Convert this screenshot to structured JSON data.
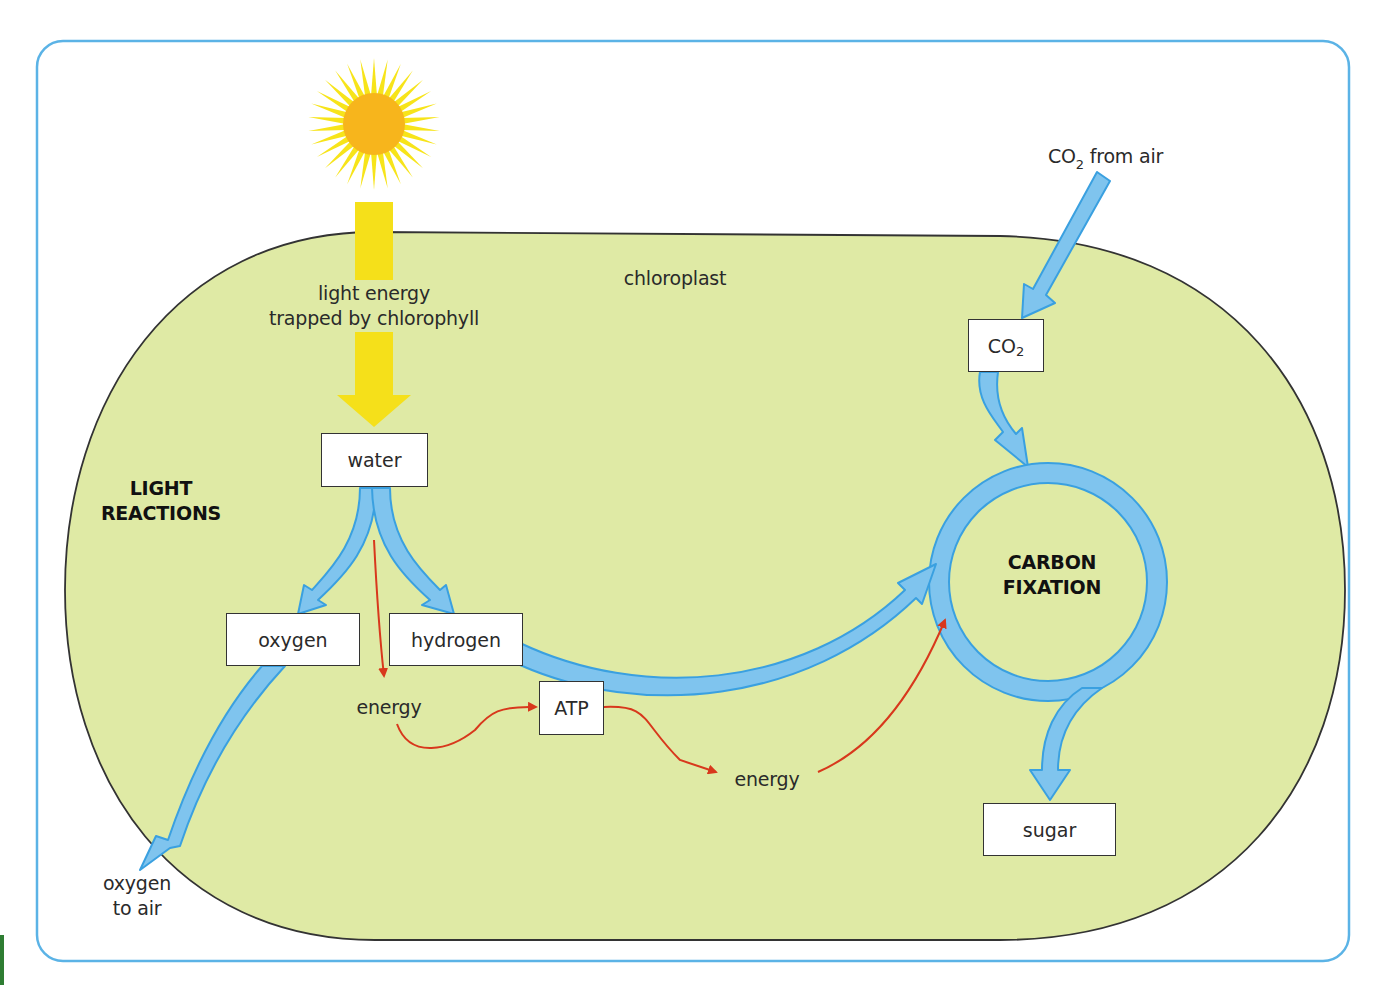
{
  "diagram": {
    "title_region": "chloroplast",
    "colors": {
      "frame_border": "#5bb3e6",
      "chloroplast_fill": "#dfeaa5",
      "chloroplast_outline": "#333333",
      "flow_arrow_fill": "#7fc4ee",
      "flow_arrow_stroke": "#3aa0e0",
      "light_arrow": "#f5e01a",
      "sun_core": "#f7b51c",
      "sun_rays": "#f7e41a",
      "energy_arrow": "#d8381c"
    },
    "labels": {
      "chloroplast": "chloroplast",
      "light_energy_line1": "light energy",
      "light_energy_line2": "trapped by chlorophyll",
      "light_reactions_line1": "LIGHT",
      "light_reactions_line2": "REACTIONS",
      "carbon_fixation_line1": "CARBON",
      "carbon_fixation_line2": "FIXATION",
      "co2_from_air_prefix": "CO",
      "co2_from_air_sub": "2",
      "co2_from_air_suffix": " from air",
      "oxygen_to_air_line1": "oxygen",
      "oxygen_to_air_line2": "to air",
      "energy_1": "energy",
      "energy_2": "energy"
    },
    "boxes": {
      "water": "water",
      "oxygen": "oxygen",
      "hydrogen": "hydrogen",
      "atp": "ATP",
      "co2_prefix": "CO",
      "co2_sub": "2",
      "sugar": "sugar"
    },
    "icons": {
      "sun": "sun-icon"
    }
  }
}
